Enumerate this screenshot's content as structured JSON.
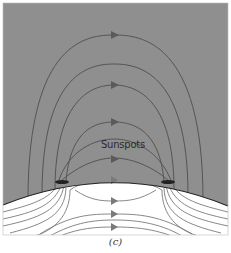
{
  "figure": {
    "caption": "(c)",
    "labels": {
      "sunspots": "Sunspots"
    },
    "colors": {
      "corona_background": "#8f8f8f",
      "interior_background": "#ffffff",
      "field_line": "#555555",
      "interior_field_line": "#7a7a7a",
      "surface_line": "#222222",
      "arrow": "#5a5a5a"
    },
    "elements": {
      "outer_loops": 2,
      "inner_loops": 3,
      "interior_flow_lines": 8,
      "sunspot_count": 2
    }
  }
}
